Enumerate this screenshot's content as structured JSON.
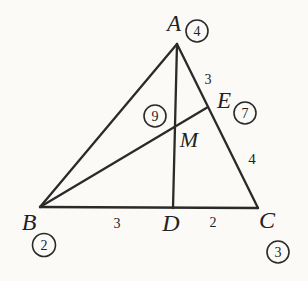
{
  "figure": {
    "type": "geometry-diagram",
    "vertices": {
      "A": "A",
      "B": "B",
      "C": "C"
    },
    "points": {
      "D": "D",
      "E": "E",
      "M": "M"
    },
    "circled": {
      "near_A": "4",
      "near_B": "2",
      "near_C": "3",
      "near_E": "7",
      "near_M": "9"
    },
    "lengths": {
      "AE": "3",
      "EC": "4",
      "BD": "3",
      "DC": "2"
    },
    "colors": {
      "ink": "#2a2a2a",
      "paper": "#fbfaf7"
    }
  }
}
